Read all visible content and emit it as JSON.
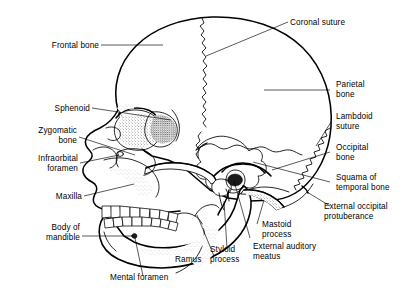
{
  "figure": {
    "style": "black-and-white line drawing with stippled shading",
    "background_color": "#ffffff",
    "line_color": "#000000"
  },
  "labels_left": [
    {
      "id": "frontal-bone",
      "text": "Frontal bone",
      "lines": [
        "Frontal bone"
      ]
    },
    {
      "id": "sphenoid",
      "text": "Sphenoid",
      "lines": [
        "Sphenoid"
      ]
    },
    {
      "id": "zygomatic-bone",
      "text": "Zygomatic bone",
      "lines": [
        "Zygomatic",
        "bone"
      ]
    },
    {
      "id": "infraorbital-foramen",
      "text": "Infraorbital foramen",
      "lines": [
        "Infraorbital",
        "foramen"
      ]
    },
    {
      "id": "maxilla",
      "text": "Maxilla",
      "lines": [
        "Maxilla"
      ]
    },
    {
      "id": "body-of-mandible",
      "text": "Body of mandible",
      "lines": [
        "Body of",
        "mandible"
      ]
    }
  ],
  "labels_right": [
    {
      "id": "coronal-suture",
      "text": "Coronal suture",
      "lines": [
        "Coronal suture"
      ]
    },
    {
      "id": "parietal-bone",
      "text": "Parietal bone",
      "lines": [
        "Parietal",
        "bone"
      ]
    },
    {
      "id": "lambdoid-suture",
      "text": "Lambdoid suture",
      "lines": [
        "Lambdoid",
        "suture"
      ]
    },
    {
      "id": "occipital-bone",
      "text": "Occipital bone",
      "lines": [
        "Occipital",
        "bone"
      ]
    },
    {
      "id": "squama-of-temporal-bone",
      "text": "Squama of temporal bone",
      "lines": [
        "Squama of",
        "temporal bone"
      ]
    },
    {
      "id": "external-occipital-protuberance",
      "text": "External occipital protuberance",
      "lines": [
        "External occipital",
        "protuberance"
      ]
    }
  ],
  "labels_bottom": [
    {
      "id": "mental-foramen",
      "text": "Mental foramen",
      "lines": [
        "Mental foramen"
      ]
    },
    {
      "id": "ramus",
      "text": "Ramus",
      "lines": [
        "Ramus"
      ]
    },
    {
      "id": "styloid-process",
      "text": "Styloid process",
      "lines": [
        "Styloid",
        "process"
      ]
    },
    {
      "id": "external-auditory-meatus",
      "text": "External auditory meatus",
      "lines": [
        "External auditory",
        "meatus"
      ]
    },
    {
      "id": "mastoid-process",
      "text": "Mastoid process",
      "lines": [
        "Mastoid",
        "process"
      ]
    }
  ],
  "text": {
    "frontal_bone": "Frontal bone",
    "sphenoid": "Sphenoid",
    "zygomatic_1": "Zygomatic",
    "zygomatic_2": "bone",
    "infraorbital_1": "Infraorbital",
    "infraorbital_2": "foramen",
    "maxilla": "Maxilla",
    "body_mandible_1": "Body of",
    "body_mandible_2": "mandible",
    "coronal_suture": "Coronal suture",
    "parietal_1": "Parietal",
    "parietal_2": "bone",
    "lambdoid_1": "Lambdoid",
    "lambdoid_2": "suture",
    "occipital_1": "Occipital",
    "occipital_2": "bone",
    "squama_1": "Squama of",
    "squama_2": "temporal bone",
    "eop_1": "External occipital",
    "eop_2": "protuberance",
    "mastoid_1": "Mastoid",
    "mastoid_2": "process",
    "eam_1": "External auditory",
    "eam_2": "meatus",
    "styloid_1": "Styloid",
    "styloid_2": "process",
    "ramus": "Ramus",
    "mental_foramen": "Mental foramen"
  }
}
